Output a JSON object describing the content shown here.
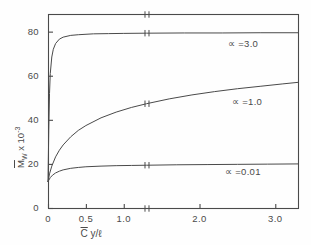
{
  "figure": {
    "background_color": "#fefefe",
    "ink_color": "#4a4a4a"
  },
  "axes": {
    "frame": {
      "left": 48,
      "right": 298,
      "top": 14,
      "bottom": 208
    },
    "y_axis": {
      "label_main": "M",
      "label_sub": "W",
      "label_mult": " x 10",
      "label_exp": "-3",
      "ticks": [
        "0",
        "20",
        "40",
        "60",
        "80"
      ],
      "tick_values": [
        0,
        20,
        40,
        60,
        80
      ],
      "range": [
        0,
        88
      ]
    },
    "x_axis": {
      "label_main": "C",
      "label_rest": "  y/ℓ",
      "ticks": [
        "0",
        "0.5",
        "1.0",
        "2.0",
        "3.0"
      ],
      "tick_values": [
        0,
        0.5,
        1.0,
        2.0,
        3.0
      ],
      "range": [
        0,
        3.3
      ],
      "break_at": 1.3
    }
  },
  "curve_labels": [
    {
      "text": "∝ =3.0",
      "x": 228,
      "y": 38
    },
    {
      "text": "∝ =1.0",
      "x": 232,
      "y": 96
    },
    {
      "text": "∝ =0.01",
      "x": 225,
      "y": 166
    }
  ],
  "chart_data": {
    "type": "line",
    "title": "",
    "xlabel": "C̄  y/ℓ",
    "ylabel": "M̄_W x 10^-3",
    "xlim": [
      0,
      3.3
    ],
    "ylim": [
      0,
      88
    ],
    "grid": false,
    "legend_position": "inline-right",
    "axis_break": {
      "axis": "x",
      "at": 1.3,
      "style": "double-tick"
    },
    "x_ticks": [
      0,
      0.5,
      1.0,
      2.0,
      3.0
    ],
    "y_ticks": [
      0,
      20,
      40,
      60,
      80
    ],
    "series": [
      {
        "name": "∝ =3.0",
        "label": "∝ =3.0",
        "color": "#4a4a4a",
        "x": [
          0,
          0.01,
          0.02,
          0.03,
          0.05,
          0.07,
          0.1,
          0.15,
          0.2,
          0.3,
          0.4,
          0.6,
          0.8,
          1.0,
          1.3,
          1.8,
          2.3,
          2.8,
          3.3
        ],
        "y": [
          12.0,
          35.0,
          52.0,
          61.0,
          68.5,
          72.0,
          74.6,
          76.6,
          77.5,
          78.3,
          78.6,
          79.0,
          79.1,
          79.2,
          79.3,
          79.4,
          79.4,
          79.5,
          79.5
        ]
      },
      {
        "name": "∝ =1.0",
        "label": "∝ =1.0",
        "color": "#4a4a4a",
        "x": [
          0,
          0.02,
          0.05,
          0.1,
          0.15,
          0.2,
          0.3,
          0.4,
          0.5,
          0.7,
          0.9,
          1.1,
          1.3,
          1.6,
          1.9,
          2.2,
          2.5,
          2.8,
          3.1,
          3.3
        ],
        "y": [
          12.0,
          15.5,
          19.0,
          23.2,
          26.2,
          28.6,
          32.3,
          35.2,
          37.4,
          40.9,
          43.5,
          45.6,
          47.3,
          49.5,
          51.3,
          52.8,
          54.1,
          55.2,
          56.3,
          57.0
        ]
      },
      {
        "name": "∝ =0.01",
        "label": "∝ =0.01",
        "color": "#4a4a4a",
        "x": [
          0,
          0.03,
          0.06,
          0.1,
          0.15,
          0.2,
          0.3,
          0.4,
          0.5,
          0.7,
          0.9,
          1.1,
          1.3,
          1.7,
          2.1,
          2.5,
          2.9,
          3.3
        ],
        "y": [
          12.0,
          13.8,
          14.9,
          15.9,
          16.7,
          17.3,
          18.0,
          18.4,
          18.7,
          19.0,
          19.2,
          19.3,
          19.4,
          19.6,
          19.7,
          19.8,
          19.9,
          20.0
        ]
      }
    ]
  }
}
